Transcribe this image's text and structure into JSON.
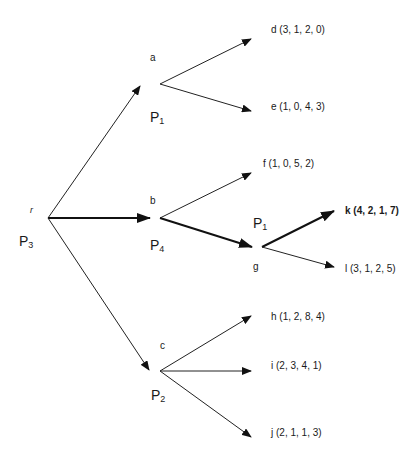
{
  "diagram": {
    "type": "game-tree",
    "nodes": {
      "r": {
        "label": "r",
        "player": "P",
        "player_sub": "3"
      },
      "a": {
        "label": "a",
        "player": "P",
        "player_sub": "1"
      },
      "b": {
        "label": "b",
        "player": "P",
        "player_sub": "4"
      },
      "c": {
        "label": "c",
        "player": "P",
        "player_sub": "2"
      },
      "g": {
        "label": "g",
        "player": "P",
        "player_sub": "1"
      }
    },
    "leaves": [
      {
        "id": "d",
        "text": "d (3, 1, 2, 0)",
        "bold": false
      },
      {
        "id": "e",
        "text": "e (1, 0, 4, 3)",
        "bold": false
      },
      {
        "id": "f",
        "text": "f (1, 0, 5, 2)",
        "bold": false
      },
      {
        "id": "k",
        "text": "k (4, 2, 1, 7)",
        "bold": true
      },
      {
        "id": "l",
        "text": "l (3, 1, 2, 5)",
        "bold": false
      },
      {
        "id": "h",
        "text": "h (1, 2, 8, 4)",
        "bold": false
      },
      {
        "id": "i",
        "text": "i (2, 3, 4, 1)",
        "bold": false
      },
      {
        "id": "j",
        "text": "j (2, 1, 1, 3)",
        "bold": false
      }
    ],
    "edges": [
      {
        "from": "r",
        "to": "a",
        "bold": false
      },
      {
        "from": "r",
        "to": "b",
        "bold": true
      },
      {
        "from": "r",
        "to": "c",
        "bold": false
      },
      {
        "from": "a",
        "to": "d",
        "bold": false
      },
      {
        "from": "a",
        "to": "e",
        "bold": false
      },
      {
        "from": "b",
        "to": "f",
        "bold": false
      },
      {
        "from": "b",
        "to": "g",
        "bold": true
      },
      {
        "from": "g",
        "to": "k",
        "bold": true
      },
      {
        "from": "g",
        "to": "l",
        "bold": false
      },
      {
        "from": "c",
        "to": "h",
        "bold": false
      },
      {
        "from": "c",
        "to": "i",
        "bold": false
      },
      {
        "from": "c",
        "to": "j",
        "bold": false
      }
    ]
  }
}
